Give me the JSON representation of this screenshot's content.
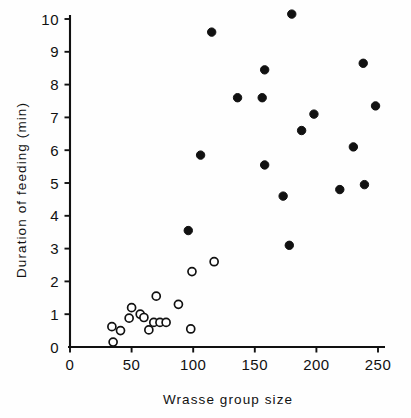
{
  "chart_data": {
    "type": "scatter",
    "title": "",
    "xlabel": "Wrasse group size",
    "ylabel": "Duration of feeding (min)",
    "xlim": [
      0,
      255
    ],
    "ylim": [
      0,
      10.4
    ],
    "xticks": [
      0,
      50,
      100,
      150,
      200,
      250
    ],
    "xtick_labels": [
      "0",
      "50",
      "100",
      "150",
      "200",
      "250"
    ],
    "yticks": [
      0,
      1,
      2,
      3,
      4,
      5,
      6,
      7,
      8,
      9,
      10
    ],
    "ytick_labels": [
      "0",
      "1",
      "2",
      "3",
      "4",
      "5",
      "6",
      "7",
      "8",
      "9",
      "10"
    ],
    "grid": false,
    "legend": "none",
    "series": [
      {
        "name": "open-circles",
        "marker": "open-circle",
        "color": "#111111",
        "fill": "#ffffff",
        "points": [
          {
            "x": 35,
            "y": 0.15
          },
          {
            "x": 34,
            "y": 0.62
          },
          {
            "x": 41,
            "y": 0.5
          },
          {
            "x": 48,
            "y": 0.88
          },
          {
            "x": 50,
            "y": 1.2
          },
          {
            "x": 57,
            "y": 1.0
          },
          {
            "x": 60,
            "y": 0.9
          },
          {
            "x": 64,
            "y": 0.52
          },
          {
            "x": 68,
            "y": 0.75
          },
          {
            "x": 70,
            "y": 1.55
          },
          {
            "x": 73,
            "y": 0.75
          },
          {
            "x": 78,
            "y": 0.75
          },
          {
            "x": 88,
            "y": 1.3
          },
          {
            "x": 98,
            "y": 0.55
          },
          {
            "x": 99,
            "y": 2.3
          },
          {
            "x": 117,
            "y": 2.6
          }
        ]
      },
      {
        "name": "filled-circles",
        "marker": "filled-circle",
        "color": "#111111",
        "fill": "#111111",
        "points": [
          {
            "x": 96,
            "y": 3.55
          },
          {
            "x": 106,
            "y": 5.85
          },
          {
            "x": 115,
            "y": 9.6
          },
          {
            "x": 136,
            "y": 7.6
          },
          {
            "x": 156,
            "y": 7.6
          },
          {
            "x": 158,
            "y": 5.55
          },
          {
            "x": 158,
            "y": 8.45
          },
          {
            "x": 173,
            "y": 4.6
          },
          {
            "x": 178,
            "y": 3.1
          },
          {
            "x": 180,
            "y": 10.15
          },
          {
            "x": 188,
            "y": 6.6
          },
          {
            "x": 198,
            "y": 7.1
          },
          {
            "x": 219,
            "y": 4.8
          },
          {
            "x": 230,
            "y": 6.1
          },
          {
            "x": 238,
            "y": 8.65
          },
          {
            "x": 239,
            "y": 4.95
          },
          {
            "x": 248,
            "y": 7.35
          }
        ]
      }
    ]
  },
  "axes": {
    "x_axis_name": "wrasse-group-size-axis",
    "y_axis_name": "duration-of-feeding-axis"
  }
}
